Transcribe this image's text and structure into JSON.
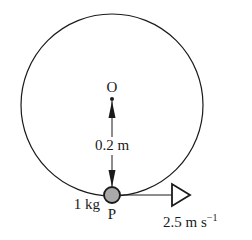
{
  "diagram": {
    "type": "circular-motion",
    "center_label": "O",
    "radius_label": "0.2 m",
    "mass_label": "1 kg",
    "particle_label": "P",
    "velocity_label_main": "2.5 m s",
    "velocity_label_exp": "−1",
    "colors": {
      "stroke": "#1a1a1a",
      "particle_fill": "#a9a9a9"
    }
  }
}
